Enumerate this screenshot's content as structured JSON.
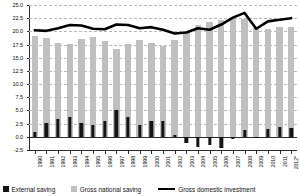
{
  "chart_data": {
    "type": "bar",
    "title": "",
    "subtitle": "",
    "xlabel": "",
    "ylabel": "",
    "ylim": [
      -2.5,
      25.0
    ],
    "ytick_step": 2.5,
    "yticks": [
      "25.0",
      "22.5",
      "20.0",
      "17.5",
      "15.0",
      "12.5",
      "10.0",
      "7.5",
      "5.0",
      "2.5",
      "0.0",
      "-2.5"
    ],
    "ytick_values": [
      25.0,
      22.5,
      20.0,
      17.5,
      15.0,
      12.5,
      10.0,
      7.5,
      5.0,
      2.5,
      0.0,
      -2.5
    ],
    "grid": true,
    "grid_style": "dashed-horizontal",
    "legend_position": "bottom",
    "categories": [
      "1990",
      "1991",
      "1992",
      "1993",
      "1994",
      "1995",
      "1996",
      "1997",
      "1998",
      "1999",
      "2000",
      "2001",
      "2002",
      "2003",
      "2004",
      "2005",
      "2006",
      "2007",
      "2008",
      "2009",
      "2010",
      "2011",
      "2012*"
    ],
    "series": [
      {
        "name": "External saving",
        "type": "bar",
        "color": "#141414",
        "values": [
          1.0,
          2.6,
          3.4,
          3.8,
          2.7,
          2.3,
          3.0,
          5.0,
          3.7,
          2.3,
          3.0,
          3.0,
          0.4,
          -1.2,
          -2.0,
          -1.5,
          -2.2,
          -0.5,
          1.2,
          -0.2,
          1.4,
          1.8,
          1.6
        ]
      },
      {
        "name": "Gross national saving",
        "type": "bar",
        "color": "#bfbfbf",
        "values": [
          19.2,
          18.7,
          17.8,
          17.6,
          18.5,
          18.9,
          18.2,
          16.7,
          17.6,
          18.4,
          17.8,
          17.3,
          18.4,
          20.0,
          21.2,
          21.7,
          22.2,
          22.4,
          22.3,
          20.7,
          20.5,
          20.8,
          20.9
        ]
      },
      {
        "name": "Gross domestic investment",
        "type": "line",
        "color": "#000000",
        "values": [
          20.2,
          20.1,
          20.6,
          21.2,
          21.1,
          20.5,
          20.4,
          21.3,
          21.2,
          20.6,
          20.8,
          20.3,
          19.6,
          19.8,
          20.6,
          20.3,
          21.3,
          22.6,
          23.5,
          20.5,
          21.9,
          22.2,
          22.5
        ]
      }
    ],
    "legend": [
      {
        "label": "External saving",
        "marker": "square",
        "color": "#141414"
      },
      {
        "label": "Gross national saving",
        "marker": "square",
        "color": "#bfbfbf"
      },
      {
        "label": "Gross domestic investment",
        "marker": "line",
        "color": "#000000"
      }
    ]
  }
}
